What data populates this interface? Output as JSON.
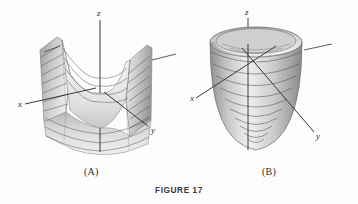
{
  "figure": {
    "caption": "FIGURE 17",
    "panels": [
      {
        "id": "A",
        "label": "(A)",
        "surface_name": "hyperbolic-paraboloid-saddle",
        "axes": {
          "x": "x",
          "y": "y",
          "z": "z"
        }
      },
      {
        "id": "B",
        "label": "(B)",
        "surface_name": "elliptic-paraboloid-bowl",
        "axes": {
          "x": "x",
          "y": "y",
          "z": "z"
        }
      }
    ]
  },
  "colors": {
    "background": "#fdfdfd",
    "ink": "#2b2b2b",
    "axis": "#3a3a3a",
    "surface_light": "#f2f2f2",
    "surface_mid": "#bdbdbd",
    "surface_dark": "#8a8a8a",
    "surface_shadow": "#6a6a6a",
    "contour": "#4a4a4a"
  }
}
